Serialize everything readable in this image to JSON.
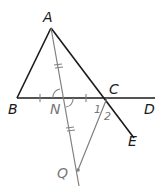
{
  "diagram": {
    "type": "geometry",
    "colors": {
      "primary_line": "#1a1a1a",
      "construction_line": "#808080",
      "background": "#ffffff"
    },
    "points": {
      "A": {
        "label": "A",
        "x": 51,
        "y": 28
      },
      "B": {
        "label": "B",
        "x": 17,
        "y": 98
      },
      "C": {
        "label": "C",
        "x": 107,
        "y": 98
      },
      "D": {
        "label": "D",
        "x": 155,
        "y": 98
      },
      "E": {
        "label": "E",
        "x": 134,
        "y": 138
      },
      "N": {
        "label": "N",
        "x": 63,
        "y": 98
      },
      "Q": {
        "label": "Q",
        "x": 78,
        "y": 170
      }
    },
    "angle_labels": {
      "angle1": "1",
      "angle2": "2"
    },
    "segments": [
      {
        "from": "A",
        "to": "B",
        "style": "solid-dark"
      },
      {
        "from": "A",
        "to": "E",
        "style": "solid-dark",
        "through": "C"
      },
      {
        "from": "B",
        "to": "D",
        "style": "solid-dark",
        "through": [
          "N",
          "C"
        ]
      },
      {
        "from": "A",
        "to": "Q",
        "style": "gray",
        "through": "N"
      },
      {
        "from": "C",
        "to": "Q",
        "style": "gray"
      }
    ],
    "marks": {
      "BN_NC_equal": "single tick",
      "AN_NQ_equal": "double tick",
      "angle_ANB_ANC": "arcs at N (vertical angles)"
    }
  }
}
